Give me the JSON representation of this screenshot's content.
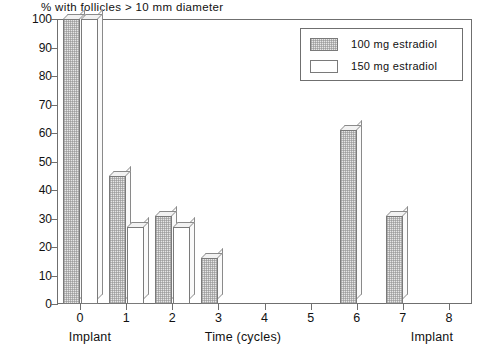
{
  "chart_data": {
    "type": "bar",
    "title": "% with follicles > 10 mm diameter",
    "xlabel": "Time (cycles)",
    "ylabel": "",
    "xlim": [
      -0.5,
      8.5
    ],
    "ylim": [
      0,
      100
    ],
    "grid": false,
    "legend_position": "top-right",
    "categories": [
      "0",
      "1",
      "2",
      "3",
      "4",
      "5",
      "6",
      "7",
      "8"
    ],
    "x_tick_labels": [
      "0",
      "1",
      "2",
      "3",
      "4",
      "5",
      "6",
      "7",
      "8"
    ],
    "y_tick_labels": [
      "0",
      "10",
      "20",
      "30",
      "40",
      "50",
      "60",
      "70",
      "80",
      "90",
      "100"
    ],
    "y_ticks": [
      0,
      10,
      20,
      30,
      40,
      50,
      60,
      70,
      80,
      90,
      100
    ],
    "series": [
      {
        "name": "100 mg estradiol",
        "fill": "hatched",
        "values": [
          100,
          45,
          31,
          16,
          0,
          0,
          61,
          31,
          0
        ]
      },
      {
        "name": "150 mg estradiol",
        "fill": "white",
        "values": [
          100,
          27,
          27,
          0,
          0,
          0,
          0,
          0,
          0
        ]
      }
    ],
    "annotations": [
      {
        "text": "Implant",
        "position": "below-x-axis-left"
      },
      {
        "text": "Time (cycles)",
        "position": "below-x-axis-center"
      },
      {
        "text": "Implant",
        "position": "below-x-axis-right"
      }
    ]
  },
  "axis_captions": {
    "left_implant": "Implant",
    "center": "Time (cycles)",
    "right_implant": "Implant"
  },
  "legend": {
    "entries": [
      {
        "label": "100 mg estradiol",
        "fill": "hatched"
      },
      {
        "label": "150 mg estradiol",
        "fill": "white"
      }
    ]
  },
  "colors": {
    "frame": "#6f6f6f",
    "bar_outline": "#7a7a7a",
    "hatch_fill": "#e6e6e6",
    "plain_fill": "#ffffff",
    "text": "#111111",
    "background": "#ffffff"
  }
}
